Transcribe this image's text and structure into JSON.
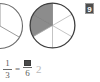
{
  "page": {
    "background_color": "#ffffff"
  },
  "badge": {
    "label": "9",
    "background_color": "#4d4d4d",
    "text_color": "#ffffff"
  },
  "models": {
    "left_circle": {
      "name": "fraction-circle-thirds",
      "total_parts": 3,
      "shaded_parts": 1,
      "fraction": "1/3",
      "cropped": true,
      "stroke_color": "#5a5a5a",
      "fill_color": "#ffffff"
    },
    "right_circle": {
      "name": "fraction-circle-sixths",
      "total_parts": 6,
      "shaded_parts": 2,
      "fraction": "2/6",
      "cropped": false,
      "stroke_color": "#3f3f3f",
      "divider_color": "#a8a8a8",
      "shade_color": "#8c8c8c",
      "fill_color": "#ffffff"
    }
  },
  "equation": {
    "left_fraction": {
      "numerator": "1",
      "denominator": "3"
    },
    "equals": "=",
    "right_fraction": {
      "numerator_placeholder": "",
      "denominator": "6"
    },
    "trailing_value": "2"
  },
  "colors": {
    "text": "#5b5b5b",
    "rule": "#6a6a6a",
    "blank_fill": "#4a4a4a",
    "faint_text": "#b9b9b9"
  }
}
